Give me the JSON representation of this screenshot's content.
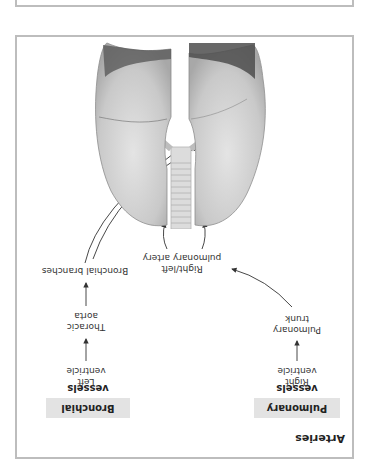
{
  "figure": {
    "title": "Arteries",
    "columns": [
      {
        "header": "Pulmonary vessels",
        "steps": [
          "Right ventricle",
          "Pulmonary trunk",
          "Right/left pulmonary artery"
        ]
      },
      {
        "header": "Bronchial vessels",
        "steps": [
          "Left ventricle",
          "Thoracic aorta",
          "Bronchial branches"
        ]
      }
    ],
    "labels": {
      "right_ventricle_1": "Right",
      "right_ventricle_2": "ventricle",
      "pulmonary_trunk_1": "Pulmonary",
      "pulmonary_trunk_2": "trunk",
      "pulmonary_artery_1": "Right/left",
      "pulmonary_artery_2": "pulmonary artery",
      "left_ventricle_1": "Left",
      "left_ventricle_2": "ventricle",
      "thoracic_aorta_1": "Thoracic",
      "thoracic_aorta_2": "aorta",
      "bronchial_branches": "Bronchial branches"
    },
    "illustration": "lungs-with-trachea",
    "orientation": "rotated 180°",
    "colors": {
      "border": "#bdbdbd",
      "header_bg": "#e3e3e3",
      "text": "#222222",
      "arrow": "#333333"
    }
  }
}
